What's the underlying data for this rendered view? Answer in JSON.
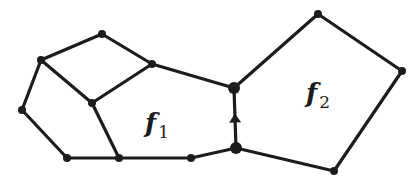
{
  "diagram": {
    "type": "planar-graph",
    "stroke_color": "#1c1c1c",
    "background": "#ffffff",
    "vertices": [
      {
        "id": "A",
        "x": 102,
        "y": 34,
        "r": 4
      },
      {
        "id": "B",
        "x": 41,
        "y": 60,
        "r": 4
      },
      {
        "id": "C",
        "x": 152,
        "y": 64,
        "r": 4
      },
      {
        "id": "D",
        "x": 92,
        "y": 103,
        "r": 4
      },
      {
        "id": "E",
        "x": 22,
        "y": 110,
        "r": 4
      },
      {
        "id": "F",
        "x": 67,
        "y": 158,
        "r": 4
      },
      {
        "id": "G",
        "x": 119,
        "y": 158,
        "r": 4
      },
      {
        "id": "H",
        "x": 191,
        "y": 158,
        "r": 4
      },
      {
        "id": "J",
        "x": 234,
        "y": 88,
        "r": 6
      },
      {
        "id": "K",
        "x": 236,
        "y": 148,
        "r": 6
      },
      {
        "id": "L",
        "x": 318,
        "y": 14,
        "r": 4
      },
      {
        "id": "M",
        "x": 402,
        "y": 71,
        "r": 4
      },
      {
        "id": "N",
        "x": 334,
        "y": 171,
        "r": 4
      }
    ],
    "edges": [
      {
        "from": "A",
        "to": "B"
      },
      {
        "from": "A",
        "to": "C"
      },
      {
        "from": "B",
        "to": "D"
      },
      {
        "from": "C",
        "to": "D"
      },
      {
        "from": "B",
        "to": "E"
      },
      {
        "from": "E",
        "to": "F"
      },
      {
        "from": "F",
        "to": "G"
      },
      {
        "from": "G",
        "to": "H"
      },
      {
        "from": "D",
        "to": "G"
      },
      {
        "from": "C",
        "to": "J"
      },
      {
        "from": "H",
        "to": "K"
      },
      {
        "from": "K",
        "to": "J",
        "directed": true
      },
      {
        "from": "J",
        "to": "L"
      },
      {
        "from": "L",
        "to": "M"
      },
      {
        "from": "M",
        "to": "N"
      },
      {
        "from": "N",
        "to": "K"
      }
    ],
    "faces": [
      {
        "id": "f1",
        "symbol": "f",
        "subscript": "1",
        "x": 145,
        "y": 108
      },
      {
        "id": "f2",
        "symbol": "f",
        "subscript": "2",
        "x": 306,
        "y": 78
      }
    ]
  }
}
